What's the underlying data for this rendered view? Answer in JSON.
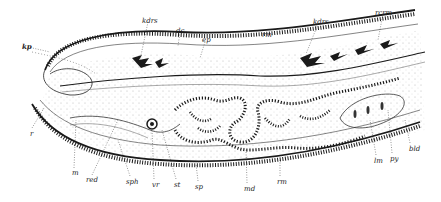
{
  "figure": {
    "type": "anatomical-line-drawing",
    "ink_color": "#1a1a1a",
    "background": "#ffffff"
  },
  "labels": {
    "top": [
      {
        "id": "kdrs_1",
        "text": "kdrs",
        "x": 142,
        "y": 18
      },
      {
        "id": "dc",
        "text": "dc",
        "x": 176,
        "y": 28
      },
      {
        "id": "ep",
        "text": "ep",
        "x": 202,
        "y": 37
      },
      {
        "id": "rm_top",
        "text": "rm",
        "x": 262,
        "y": 32
      },
      {
        "id": "kdrs_2",
        "text": "kdrs",
        "x": 313,
        "y": 19
      },
      {
        "id": "rcrm",
        "text": "rcrm",
        "x": 375,
        "y": 10
      }
    ],
    "left": [
      {
        "id": "kp",
        "text": "kp",
        "x": 22,
        "y": 43
      },
      {
        "id": "r",
        "text": "r",
        "x": 30,
        "y": 131
      }
    ],
    "bottom": [
      {
        "id": "m",
        "text": "m",
        "x": 72,
        "y": 170
      },
      {
        "id": "red",
        "text": "red",
        "x": 86,
        "y": 177
      },
      {
        "id": "sph",
        "text": "sph",
        "x": 126,
        "y": 179
      },
      {
        "id": "vr",
        "text": "vr",
        "x": 152,
        "y": 182
      },
      {
        "id": "st",
        "text": "st",
        "x": 174,
        "y": 182
      },
      {
        "id": "sp",
        "text": "sp",
        "x": 195,
        "y": 184
      },
      {
        "id": "md",
        "text": "md",
        "x": 244,
        "y": 186
      },
      {
        "id": "rm_bottom",
        "text": "rm",
        "x": 277,
        "y": 179
      }
    ],
    "right": [
      {
        "id": "lm",
        "text": "lm",
        "x": 374,
        "y": 158
      },
      {
        "id": "py",
        "text": "py",
        "x": 390,
        "y": 156
      },
      {
        "id": "bld",
        "text": "bld",
        "x": 409,
        "y": 146
      }
    ]
  }
}
